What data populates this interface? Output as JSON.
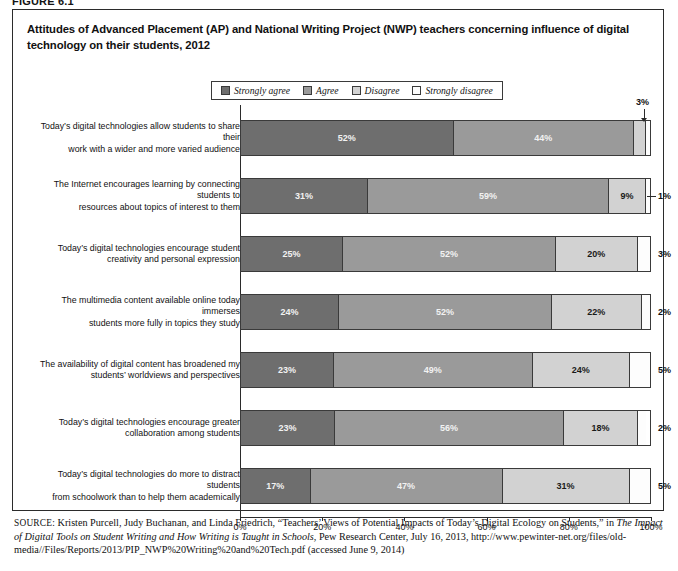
{
  "figure_label": "FIGURE 6.1",
  "title": "Attitudes of Advanced Placement (AP) and National Writing Project (NWP) teachers concerning influence of digital technology on their students, 2012",
  "legend": {
    "items": [
      {
        "label": "Strongly agree",
        "color": "#6e6e6e"
      },
      {
        "label": "Agree",
        "color": "#9a9a9a"
      },
      {
        "label": "Disagree",
        "color": "#d2d2d2"
      },
      {
        "label": "Strongly disagree",
        "color": "#fdfdfd"
      }
    ]
  },
  "axis": {
    "ticks": [
      "0%",
      "20%",
      "40%",
      "60%",
      "80%",
      "100%"
    ],
    "min": 0,
    "max": 100
  },
  "source": {
    "kicker": "SOURCE:",
    "line1": " Kristen Purcell, Judy Buchanan, and Linda Friedrich, “Teachers’ Views of Potential Impacts of Today’s Digital Ecology on Students,” in ",
    "italic": "The Impact of Digital Tools on Student Writing and How Writing is Taught in Schools",
    "line2": ", Pew Research Center, July 16, 2013, http://www.pewinter-net.org/files/old-media//Files/Reports/2013/PIP_NWP%20Writing%20and%20Tech.pdf (accessed June 9, 2014)"
  },
  "chart_data": {
    "type": "bar",
    "orientation": "horizontal",
    "stacked": true,
    "stack_total": 100,
    "title": "Attitudes of Advanced Placement (AP) and National Writing Project (NWP) teachers concerning influence of digital technology on their students, 2012",
    "xlabel": "",
    "ylabel": "",
    "xlim": [
      0,
      100
    ],
    "xticks": [
      0,
      20,
      40,
      60,
      80,
      100
    ],
    "xtick_labels": [
      "0%",
      "20%",
      "40%",
      "60%",
      "80%",
      "100%"
    ],
    "grid": false,
    "legend_position": "top-center",
    "series": [
      {
        "name": "Strongly agree",
        "color": "#6e6e6e",
        "values": [
          52,
          31,
          25,
          24,
          23,
          23,
          17
        ]
      },
      {
        "name": "Agree",
        "color": "#9a9a9a",
        "values": [
          44,
          59,
          52,
          52,
          49,
          56,
          47
        ]
      },
      {
        "name": "Disagree",
        "color": "#d2d2d2",
        "values": [
          3,
          9,
          20,
          22,
          24,
          18,
          31
        ]
      },
      {
        "name": "Strongly disagree",
        "color": "#fdfdfd",
        "values": [
          1,
          1,
          3,
          2,
          5,
          2,
          5
        ]
      }
    ],
    "categories": [
      "Today’s digital technologies allow students to share their work with a wider and more varied audience",
      "The Internet encourages learning by connecting students to resources about topics of interest to them",
      "Today’s digital technologies encourage student creativity and personal expression",
      "The multimedia content available online today immerses students more fully in topics they study",
      "The availability of digital content has broadened my students’ worldviews and perspectives",
      "Today’s digital technologies encourage greater collaboration among students",
      "Today’s digital technologies do more to distract students from schoolwork than to help them academically"
    ]
  },
  "rows": [
    {
      "label_line1": "Today’s digital technologies allow students to share their",
      "label_line2": "work with a wider and more varied audience",
      "segments": [
        {
          "value": 52,
          "label": "52%",
          "color": "#6e6e6e",
          "text": "light",
          "show": true
        },
        {
          "value": 44,
          "label": "44%",
          "color": "#9a9a9a",
          "text": "light",
          "show": true
        },
        {
          "value": 3,
          "label": "3%",
          "color": "#d2d2d2",
          "text": "dark",
          "show": false
        },
        {
          "value": 1,
          "label": "1%",
          "color": "#fdfdfd",
          "text": "dark",
          "show": false
        }
      ],
      "callout": {
        "label": "3%",
        "style": "top"
      }
    },
    {
      "label_line1": "The Internet encourages learning by connecting students to",
      "label_line2": "resources about topics of interest to them",
      "segments": [
        {
          "value": 31,
          "label": "31%",
          "color": "#6e6e6e",
          "text": "light",
          "show": true
        },
        {
          "value": 59,
          "label": "59%",
          "color": "#9a9a9a",
          "text": "light",
          "show": true
        },
        {
          "value": 9,
          "label": "9%",
          "color": "#d2d2d2",
          "text": "dark",
          "show": true
        },
        {
          "value": 1,
          "label": "1%",
          "color": "#fdfdfd",
          "text": "dark",
          "show": false
        }
      ],
      "callout": {
        "label": "1%",
        "style": "right"
      }
    },
    {
      "label_line1": "Today’s digital technologies encourage student",
      "label_line2": "creativity and personal expression",
      "segments": [
        {
          "value": 25,
          "label": "25%",
          "color": "#6e6e6e",
          "text": "light",
          "show": true
        },
        {
          "value": 52,
          "label": "52%",
          "color": "#9a9a9a",
          "text": "light",
          "show": true
        },
        {
          "value": 20,
          "label": "20%",
          "color": "#d2d2d2",
          "text": "dark",
          "show": true
        },
        {
          "value": 3,
          "label": "3%",
          "color": "#fdfdfd",
          "text": "dark",
          "show": false
        }
      ],
      "callout": {
        "label": "3%",
        "style": "plain"
      }
    },
    {
      "label_line1": "The multimedia content available online today immerses",
      "label_line2": "students more fully in topics they study",
      "segments": [
        {
          "value": 24,
          "label": "24%",
          "color": "#6e6e6e",
          "text": "light",
          "show": true
        },
        {
          "value": 52,
          "label": "52%",
          "color": "#9a9a9a",
          "text": "light",
          "show": true
        },
        {
          "value": 22,
          "label": "22%",
          "color": "#d2d2d2",
          "text": "dark",
          "show": true
        },
        {
          "value": 2,
          "label": "2%",
          "color": "#fdfdfd",
          "text": "dark",
          "show": false
        }
      ],
      "callout": {
        "label": "2%",
        "style": "plain"
      }
    },
    {
      "label_line1": "The availability of digital content has broadened my",
      "label_line2": "students’ worldviews and perspectives",
      "segments": [
        {
          "value": 23,
          "label": "23%",
          "color": "#6e6e6e",
          "text": "light",
          "show": true
        },
        {
          "value": 49,
          "label": "49%",
          "color": "#9a9a9a",
          "text": "light",
          "show": true
        },
        {
          "value": 24,
          "label": "24%",
          "color": "#d2d2d2",
          "text": "dark",
          "show": true
        },
        {
          "value": 5,
          "label": "5%",
          "color": "#fdfdfd",
          "text": "dark",
          "show": false
        }
      ],
      "callout": {
        "label": "5%",
        "style": "plain"
      }
    },
    {
      "label_line1": "Today’s digital technologies encourage greater",
      "label_line2": "collaboration among students",
      "segments": [
        {
          "value": 23,
          "label": "23%",
          "color": "#6e6e6e",
          "text": "light",
          "show": true
        },
        {
          "value": 56,
          "label": "56%",
          "color": "#9a9a9a",
          "text": "light",
          "show": true
        },
        {
          "value": 18,
          "label": "18%",
          "color": "#d2d2d2",
          "text": "dark",
          "show": true
        },
        {
          "value": 2,
          "label": "2%",
          "color": "#fdfdfd",
          "text": "dark",
          "show": false
        }
      ],
      "callout": {
        "label": "2%",
        "style": "plain"
      }
    },
    {
      "label_line1": "Today’s digital technologies do more to distract students",
      "label_line2": "from schoolwork than to help them academically",
      "segments": [
        {
          "value": 17,
          "label": "17%",
          "color": "#6e6e6e",
          "text": "light",
          "show": true
        },
        {
          "value": 47,
          "label": "47%",
          "color": "#9a9a9a",
          "text": "light",
          "show": true
        },
        {
          "value": 31,
          "label": "31%",
          "color": "#d2d2d2",
          "text": "dark",
          "show": true
        },
        {
          "value": 5,
          "label": "5%",
          "color": "#fdfdfd",
          "text": "dark",
          "show": false
        }
      ],
      "callout": {
        "label": "5%",
        "style": "plain"
      }
    }
  ]
}
